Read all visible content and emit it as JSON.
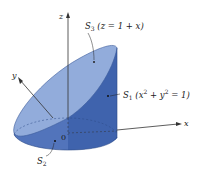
{
  "figure": {
    "axes": {
      "x_label": "x",
      "y_label": "y",
      "z_label": "z",
      "origin_label": "0"
    },
    "surfaces": [
      {
        "id": "S3",
        "name": "S",
        "index": "3",
        "equation": "(z = 1 + x)",
        "desc": "slanted top plane"
      },
      {
        "id": "S1",
        "name": "S",
        "index": "1",
        "equation_pre": "(x",
        "equation_mid": " + y",
        "equation_post": " = 1)",
        "power": "2",
        "desc": "cylinder side"
      },
      {
        "id": "S2",
        "name": "S",
        "index": "2",
        "desc": "bottom disk"
      }
    ],
    "colors": {
      "top_face": "#8fa9d9",
      "side_face": "#4a6fb8",
      "side_dark": "#3e62ad",
      "bottom_band": "#5f82c6",
      "edge": "#2c4a86",
      "axis": "#333333"
    }
  }
}
